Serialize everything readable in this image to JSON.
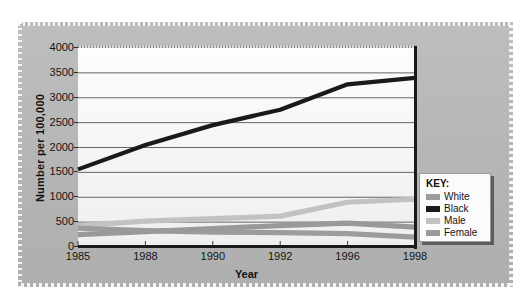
{
  "chart_data": {
    "type": "line",
    "title": "",
    "xlabel": "Year",
    "ylabel": "Number per 100,000",
    "x": [
      1985,
      1988,
      1990,
      1992,
      1996,
      1998
    ],
    "xtick_labels": [
      "1985",
      "1988",
      "1990",
      "1992",
      "1996",
      "1998"
    ],
    "ytick_labels": [
      "0",
      "500",
      "1000",
      "1500",
      "2000",
      "2500",
      "3000",
      "3500",
      "4000"
    ],
    "yticks": [
      0,
      500,
      1000,
      1500,
      2000,
      2500,
      3000,
      3500,
      4000
    ],
    "ylim": [
      0,
      4000
    ],
    "grid": "horizontal",
    "legend_position": "right-inside-bottom",
    "legend_title": "KEY:",
    "series": [
      {
        "name": "White",
        "color": "#9c9c9c",
        "values": [
          380,
          330,
          300,
          290,
          270,
          200
        ]
      },
      {
        "name": "Black",
        "color": "#1a1a1a",
        "values": [
          1560,
          2050,
          2450,
          2760,
          3270,
          3400
        ]
      },
      {
        "name": "Male",
        "color": "#c2c2c2",
        "values": [
          430,
          520,
          570,
          620,
          900,
          960
        ]
      },
      {
        "name": "Female",
        "color": "#999999",
        "values": [
          250,
          310,
          370,
          430,
          480,
          400
        ]
      }
    ]
  },
  "axis": {
    "y_title": "Number per 100,000",
    "x_title": "Year"
  },
  "legend": {
    "title": "KEY:",
    "items": [
      {
        "label": "White",
        "color": "#9c9c9c"
      },
      {
        "label": "Black",
        "color": "#1a1a1a"
      },
      {
        "label": "Male",
        "color": "#c2c2c2"
      },
      {
        "label": "Female",
        "color": "#999999"
      }
    ]
  },
  "colors": {
    "panel": "#b6b6b6",
    "plot_background": "#f7f7f7",
    "axis": "#1a1a1a",
    "gridline": "#555555"
  }
}
